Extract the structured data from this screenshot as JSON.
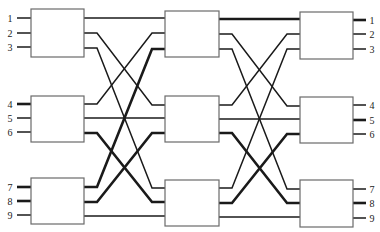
{
  "diagram": {
    "type": "three-stage switching network",
    "stages": 3,
    "switches_per_stage": 3,
    "ports_per_switch": 3,
    "input_labels": [
      "1",
      "2",
      "3",
      "4",
      "5",
      "6",
      "7",
      "8",
      "9"
    ],
    "output_labels": [
      "1",
      "2",
      "3",
      "4",
      "5",
      "6",
      "7",
      "8",
      "9"
    ],
    "thick_input_ports": [
      "4",
      "7",
      "8"
    ],
    "thick_output_ports": [
      "1",
      "5",
      "8"
    ],
    "stage1_to_stage2": [
      {
        "from": "S1.1.o1",
        "to": "S2.1.i1",
        "weight": "thin"
      },
      {
        "from": "S1.1.o2",
        "to": "S2.2.i1",
        "weight": "thin"
      },
      {
        "from": "S1.1.o3",
        "to": "S2.3.i1",
        "weight": "thin"
      },
      {
        "from": "S1.2.o1",
        "to": "S2.1.i2",
        "weight": "thin"
      },
      {
        "from": "S1.2.o2",
        "to": "S2.2.i2",
        "weight": "thin"
      },
      {
        "from": "S1.2.o3",
        "to": "S2.3.i2",
        "weight": "thick"
      },
      {
        "from": "S1.3.o1",
        "to": "S2.1.i3",
        "weight": "thick"
      },
      {
        "from": "S1.3.o2",
        "to": "S2.2.i3",
        "weight": "thick"
      },
      {
        "from": "S1.3.o3",
        "to": "S2.3.i3",
        "weight": "thin"
      }
    ],
    "stage2_to_stage3": [
      {
        "from": "S2.1.o1",
        "to": "S3.1.i1",
        "weight": "thick"
      },
      {
        "from": "S2.1.o2",
        "to": "S3.2.i1",
        "weight": "thin"
      },
      {
        "from": "S2.1.o3",
        "to": "S3.3.i1",
        "weight": "thin"
      },
      {
        "from": "S2.2.o1",
        "to": "S3.1.i2",
        "weight": "thin"
      },
      {
        "from": "S2.2.o2",
        "to": "S3.2.i2",
        "weight": "thin"
      },
      {
        "from": "S2.2.o3",
        "to": "S3.3.i2",
        "weight": "thick"
      },
      {
        "from": "S2.3.o1",
        "to": "S3.1.i3",
        "weight": "thin"
      },
      {
        "from": "S2.3.o2",
        "to": "S3.2.i3",
        "weight": "thick"
      },
      {
        "from": "S2.3.o3",
        "to": "S3.3.i3",
        "weight": "thin"
      }
    ]
  }
}
